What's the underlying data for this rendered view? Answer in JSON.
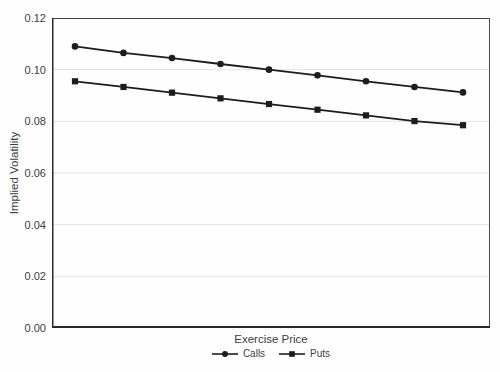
{
  "chart_data": {
    "type": "line",
    "title": "",
    "xlabel": "Exercise Price",
    "ylabel": "Implied Volatility",
    "x": [
      1,
      2,
      3,
      4,
      5,
      6,
      7,
      8,
      9
    ],
    "x_tick_labels_visible": false,
    "series": [
      {
        "name": "Calls",
        "marker": "circle",
        "values": [
          0.109,
          0.1065,
          0.1045,
          0.1022,
          0.1,
          0.0978,
          0.0955,
          0.0933,
          0.0912
        ]
      },
      {
        "name": "Puts",
        "marker": "square",
        "values": [
          0.0955,
          0.0933,
          0.0911,
          0.0889,
          0.0867,
          0.0845,
          0.0823,
          0.0801,
          0.0785
        ]
      }
    ],
    "ylim": [
      0,
      0.12
    ],
    "yticks": [
      0,
      0.02,
      0.04,
      0.06,
      0.08,
      0.1,
      0.12
    ],
    "ytick_labels": [
      "0.00",
      "0.02",
      "0.04",
      "0.06",
      "0.08",
      "0.10",
      "0.12"
    ],
    "grid": "horizontal",
    "legend_position": "bottom",
    "colors": {
      "line": "#1c1c1c",
      "marker": "#1c1c1c",
      "grid": "#e4e4e2",
      "axis_border": "#4a4a4a",
      "axis_main": "#2a2a2a",
      "text": "#3d3d3d",
      "background": "#fefefe"
    }
  }
}
